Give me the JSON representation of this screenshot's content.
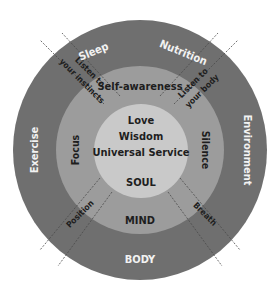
{
  "diagram": {
    "colors": {
      "background": "#ffffff",
      "outer_ring": "#6f6f6f",
      "middle_ring": "#9c9c9c",
      "inner_circle": "#c9c9c9",
      "outer_text": "#f2f2f2",
      "inner_text": "#1e1e1e",
      "divider": "#4a4a4a"
    },
    "outer_ring": {
      "title": "BODY",
      "labels": {
        "top_left": "Sleep",
        "top_right": "Nutrition",
        "left": "Exercise",
        "right": "Environment"
      }
    },
    "middle_ring": {
      "title": "MIND",
      "labels": {
        "top": "Self-awareness",
        "left": "Focus",
        "right": "Silence"
      }
    },
    "inner_circle": {
      "title": "SOUL",
      "lines": [
        "Love",
        "Wisdom",
        "Universal Service"
      ]
    },
    "bands": {
      "upper_left_line1": "Listen to",
      "upper_left_line2": "your instincts",
      "upper_right_line1": "Listen to",
      "upper_right_line2": "your body",
      "lower_left": "Position",
      "lower_right": "Breath"
    }
  }
}
